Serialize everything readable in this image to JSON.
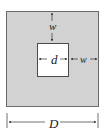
{
  "diagram": {
    "labels": {
      "wall_top": "w",
      "hole_width": "d",
      "wall_right": "w",
      "outer_width": "D"
    },
    "colors": {
      "fill": "#d2d2d2",
      "hole": "#ffffff",
      "line": "#333333"
    }
  }
}
